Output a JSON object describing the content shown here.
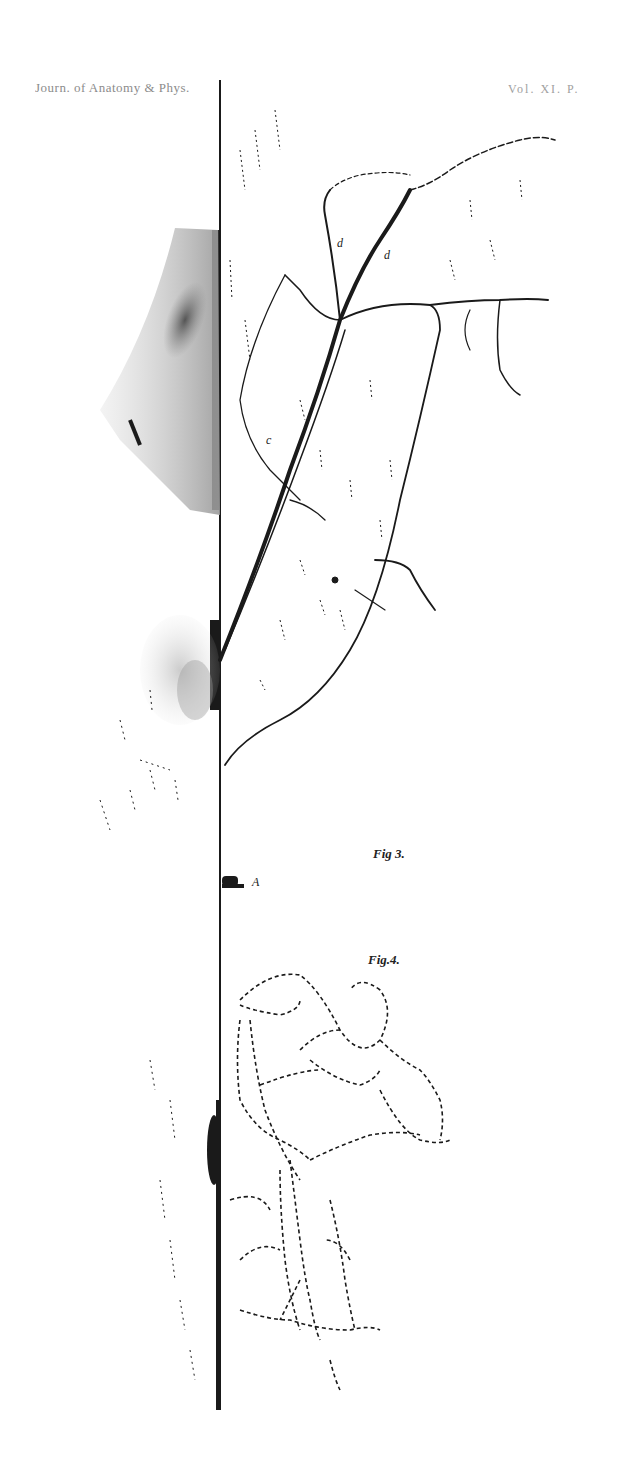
{
  "header": {
    "journal": "Journ. of Anatomy & Phys.",
    "plate": "Vol. XI. P."
  },
  "figures": [
    {
      "label": "Fig 3.",
      "x": 373,
      "y": 852
    },
    {
      "label": "Fig.4.",
      "x": 368,
      "y": 958
    }
  ],
  "annotations": [
    {
      "letter": "d",
      "x": 337,
      "y": 243
    },
    {
      "letter": "d",
      "x": 384,
      "y": 255
    },
    {
      "letter": "c",
      "x": 266,
      "y": 440
    },
    {
      "letter": "A",
      "x": 252,
      "y": 882
    }
  ],
  "colors": {
    "ink": "#1a1a1a",
    "background": "#ffffff",
    "shading": "#8a8a8a"
  }
}
